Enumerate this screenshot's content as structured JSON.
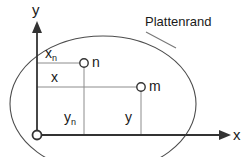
{
  "figure": {
    "title_hidden": "",
    "width": 244,
    "height": 157,
    "background_color": "#ffffff",
    "line_color": "#333333",
    "thin_line_color": "#808080",
    "text_color": "#1a1a1a"
  },
  "axes": {
    "x_label": "x",
    "y_label": "y",
    "origin_label": "",
    "origin_marker": "origin-circle",
    "x_axis_y_px": 135,
    "y_axis_x_px": 37,
    "x_axis_end_px": 228,
    "y_axis_top_px": 25
  },
  "boundary": {
    "label": "Plattenrand",
    "shape": "ellipse",
    "center_x_px": 103,
    "center_y_px": 104,
    "radius_x_px": 93,
    "radius_y_px": 68,
    "leader_from_x_px": 152,
    "leader_from_y_px": 34,
    "leader_to_x_px": 172,
    "leader_to_y_px": 46
  },
  "points": [
    {
      "id": "n",
      "label": "n",
      "marker": "open-circle",
      "cx_px": 84,
      "cy_px": 63,
      "radius_px": 4,
      "abscissa_label": "x",
      "abscissa_sub": "n",
      "ordinate_label": "y",
      "ordinate_sub": "n"
    },
    {
      "id": "m",
      "label": "m",
      "marker": "open-circle",
      "cx_px": 141,
      "cy_px": 87,
      "radius_px": 4,
      "abscissa_label": "x",
      "abscissa_sub": "",
      "ordinate_label": "y",
      "ordinate_sub": ""
    }
  ],
  "labels": {
    "xn_main": "x",
    "xn_sub": "n",
    "x_main": "x",
    "yn_main": "y",
    "yn_sub": "n",
    "y_main": "y",
    "point_n": "n",
    "point_m": "m",
    "axis_x": "x",
    "axis_y": "y",
    "callout": "Plattenrand"
  }
}
